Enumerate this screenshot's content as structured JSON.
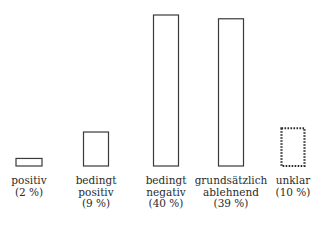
{
  "chart_data": {
    "type": "bar",
    "title": "",
    "xlabel": "",
    "ylabel": "",
    "ylim": [
      0,
      40
    ],
    "grid": false,
    "legend": "none",
    "categories": [
      [
        "positiv"
      ],
      [
        "bedingt",
        "positiv"
      ],
      [
        "bedingt",
        "negativ"
      ],
      [
        "grundsätzlich",
        "ablehnend"
      ],
      [
        "unklar"
      ]
    ],
    "values": [
      2,
      9,
      40,
      39,
      10
    ],
    "value_labels": [
      "(2 %)",
      "(9 %)",
      "(40 %)",
      "(39 %)",
      "(10 %)"
    ],
    "styles": [
      "solid",
      "solid",
      "solid",
      "solid",
      "dotted"
    ]
  }
}
